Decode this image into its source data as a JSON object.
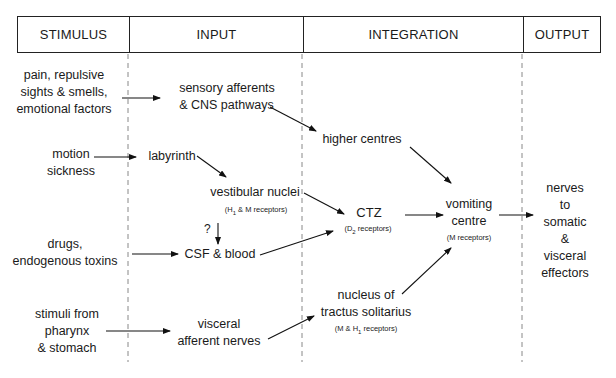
{
  "header": {
    "columns": [
      {
        "label": "STIMULUS"
      },
      {
        "label": "INPUT"
      },
      {
        "label": "INTEGRATION"
      },
      {
        "label": "OUTPUT"
      }
    ]
  },
  "stimulus": {
    "pain": "pain, repulsive\nsights & smells,\nemotional factors",
    "motion": "motion\nsickness",
    "drugs": "drugs,\nendogenous toxins",
    "pharynx": "stimuli from\npharynx\n& stomach"
  },
  "input": {
    "sensory": "sensory afferents\n& CNS pathways",
    "labyrinth": "labyrinth",
    "vestibular": "vestibular nuclei",
    "vestibular_receptors_pre": "(H",
    "vestibular_receptors_sub": "1",
    "vestibular_receptors_post": " & M receptors)",
    "question": "?",
    "csf": "CSF & blood",
    "visceral": "visceral\nafferent nerves"
  },
  "integration": {
    "higher": "higher centres",
    "ctz": "CTZ",
    "ctz_receptors_pre": "(D",
    "ctz_receptors_sub": "2",
    "ctz_receptors_post": " receptors)",
    "vomiting": "vomiting\ncentre",
    "vomiting_receptors": "(M receptors)",
    "nts": "nucleus of\ntractus solitarius",
    "nts_receptors_pre": "(M & H",
    "nts_receptors_sub": "1",
    "nts_receptors_post": " receptors)"
  },
  "output": {
    "nerves": "nerves to\nsomatic &\nvisceral\neffectors"
  }
}
